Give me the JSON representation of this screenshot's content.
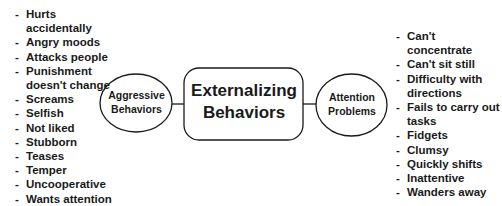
{
  "diagram": {
    "center": {
      "line1": "Externalizing",
      "line2": "Behaviors"
    },
    "left_node": {
      "line1": "Aggressive",
      "line2": "Behaviors"
    },
    "right_node": {
      "line1": "Attention",
      "line2": "Problems"
    },
    "bullet": "-",
    "left_items": [
      "Hurts accidentally",
      "Angry moods",
      "Attacks people",
      "Punishment doesn't change",
      "Screams",
      "Selfish",
      "Not liked",
      "Stubborn",
      "Teases",
      "Temper",
      "Uncooperative",
      "Wants attention"
    ],
    "right_items": [
      "Can't concentrate",
      "Can't sit still",
      "Difficulty with directions",
      "Fails to carry out tasks",
      "Fidgets",
      "Clumsy",
      "Quickly shifts",
      "Inattentive",
      "Wanders away"
    ],
    "colors": {
      "stroke": "#1a1a1a",
      "background": "#ffffff"
    }
  }
}
